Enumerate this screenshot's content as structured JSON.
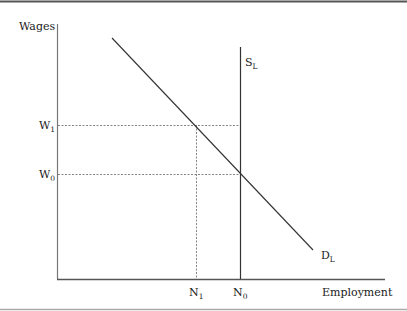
{
  "diagram": {
    "y_axis_label": "Wages",
    "x_axis_label": "Employment",
    "curves": {
      "supply": {
        "label": "S",
        "subscript": "L"
      },
      "demand": {
        "label": "D",
        "subscript": "L"
      }
    },
    "wage_levels": [
      {
        "label": "W",
        "subscript": "1"
      },
      {
        "label": "W",
        "subscript": "0"
      }
    ],
    "employment_levels": [
      {
        "label": "N",
        "subscript": "1"
      },
      {
        "label": "N",
        "subscript": "0"
      }
    ],
    "colors": {
      "line": "#333333",
      "axis": "#555555",
      "dotted": "#777777",
      "border": "#666666"
    }
  }
}
